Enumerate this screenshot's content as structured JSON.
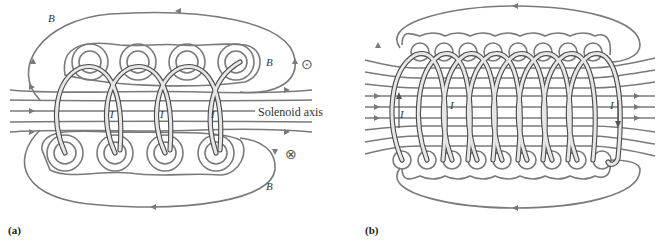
{
  "figure": {
    "panel_a": {
      "label": "(a)",
      "axis_label": "Solenoid axis",
      "field_label": "B⃗",
      "current_label": "I",
      "out_of_page_symbol": "⊙",
      "into_page_symbol": "⊗",
      "turns": 4,
      "colors": {
        "field_lines": "#7a7a7a",
        "wire": "#4a4a4a",
        "wire_fill": "#e6e6e6"
      }
    },
    "panel_b": {
      "label": "(b)",
      "current_label": "I",
      "turns": 9,
      "colors": {
        "field_lines": "#7a7a7a",
        "wire": "#4a4a4a",
        "wire_fill": "#e6e6e6"
      }
    }
  }
}
